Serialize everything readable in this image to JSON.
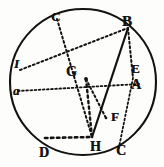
{
  "figure": {
    "kind": "geometry-diagram",
    "style": "antique-engraving",
    "background_color": "#fdfdfb",
    "ink_color": "#141210",
    "canvas": {
      "width": 164,
      "height": 167
    },
    "circle": {
      "name": "main-circle",
      "center_x": 83,
      "center_y": 82,
      "radius": 73,
      "stroke_width": 2.1,
      "stroke_style": "solid"
    },
    "points": [
      {
        "id": "B",
        "label": "B",
        "x": 128,
        "y": 28,
        "label_x": 122,
        "label_y": 14,
        "font_size": 15,
        "italic": false
      },
      {
        "id": "C1",
        "label": "C",
        "x": 57,
        "y": 19,
        "label_x": 51,
        "label_y": 10,
        "font_size": 13,
        "italic": false
      },
      {
        "id": "E",
        "label": "E",
        "x": 133,
        "y": 78,
        "label_x": 131,
        "label_y": 62,
        "font_size": 13,
        "italic": false
      },
      {
        "id": "A",
        "label": "A",
        "x": 139,
        "y": 84,
        "label_x": 131,
        "label_y": 78,
        "font_size": 14,
        "italic": false
      },
      {
        "id": "I",
        "label": "I",
        "x": 20,
        "y": 70,
        "label_x": 14,
        "label_y": 57,
        "font_size": 13,
        "italic": true
      },
      {
        "id": "a",
        "label": "a",
        "x": 18,
        "y": 91,
        "label_x": 13,
        "label_y": 84,
        "font_size": 13,
        "italic": true
      },
      {
        "id": "G",
        "label": "G",
        "x": 86,
        "y": 79,
        "label_x": 66,
        "label_y": 65,
        "font_size": 14,
        "italic": false
      },
      {
        "id": "F",
        "label": "F",
        "x": 106,
        "y": 118,
        "label_x": 111,
        "label_y": 110,
        "font_size": 13,
        "italic": false
      },
      {
        "id": "H",
        "label": "H",
        "x": 92,
        "y": 137,
        "label_x": 90,
        "label_y": 140,
        "font_size": 14,
        "italic": false
      },
      {
        "id": "C2",
        "label": "C",
        "x": 118,
        "y": 152,
        "label_x": 116,
        "label_y": 144,
        "font_size": 14,
        "italic": false
      },
      {
        "id": "D",
        "label": "D",
        "x": 45,
        "y": 138,
        "label_x": 39,
        "label_y": 146,
        "font_size": 14,
        "italic": false
      }
    ],
    "segments": [
      {
        "name": "chord-I-to-B",
        "from": "I",
        "to": "B",
        "style": "dotted",
        "width": 2.0
      },
      {
        "name": "chord-C1-to-H",
        "from": "C1",
        "to": "H",
        "style": "dotted",
        "width": 2.0
      },
      {
        "name": "chord-a-to-A",
        "from": "a",
        "to": "A",
        "style": "dotted",
        "width": 1.8
      },
      {
        "name": "chord-B-to-E",
        "from": "B",
        "to": "E",
        "style": "dotted",
        "width": 2.0
      },
      {
        "name": "chord-B-to-H",
        "from": "B",
        "to": "H",
        "style": "solid",
        "width": 2.2
      },
      {
        "name": "chord-G-to-F",
        "from": "G",
        "to": "F",
        "style": "dotted",
        "width": 2.0
      },
      {
        "name": "chord-E-to-C2",
        "from": "E",
        "to": "C2",
        "style": "dotted",
        "width": 1.8
      },
      {
        "name": "chord-G-to-H",
        "from": "G",
        "to": "H",
        "style": "dotted",
        "width": 2.4
      },
      {
        "name": "chord-D-to-H",
        "from": "D",
        "to": "H",
        "style": "dotted",
        "width": 2.6
      }
    ]
  }
}
